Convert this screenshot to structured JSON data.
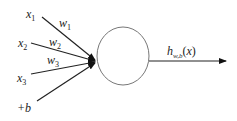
{
  "diagram": {
    "type": "neuron",
    "inputs": [
      {
        "label": "x",
        "sub": "1",
        "weight": "w",
        "weight_sub": "1"
      },
      {
        "label": "x",
        "sub": "2",
        "weight": "w",
        "weight_sub": "2"
      },
      {
        "label": "x",
        "sub": "3",
        "weight": "w",
        "weight_sub": "3"
      },
      {
        "label": "+b",
        "sub": ""
      }
    ],
    "output": {
      "label": "h",
      "sub": "w,b",
      "arg": "(x)"
    },
    "colors": {
      "line": "#222222",
      "circle": "#777777",
      "background": "#ffffff"
    }
  }
}
